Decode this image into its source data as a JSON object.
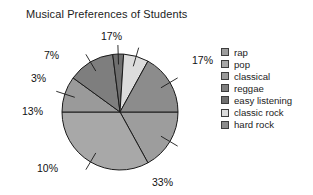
{
  "chart_data": {
    "type": "pie",
    "title": "Musical Preferences of Students",
    "xlabel": "",
    "ylabel": "",
    "legend_position": "right",
    "grid": false,
    "start_angle_deg": 0,
    "direction": "clockwise",
    "categories": [
      "rap",
      "pop",
      "classical",
      "reggae",
      "easy listening",
      "classic rock",
      "hard rock"
    ],
    "values": [
      17,
      33,
      10,
      13,
      3,
      7,
      17
    ],
    "value_labels": [
      "17%",
      "33%",
      "10%",
      "13%",
      "3%",
      "7%",
      "17%"
    ],
    "total": 100,
    "unit": "%",
    "colors": [
      "#9d9d9d",
      "#a8a8a8",
      "#9a9a9a",
      "#7e7e7e",
      "#6f6f6f",
      "#dcdcdc",
      "#8c8c8c"
    ],
    "slices": [
      {
        "label": "rap",
        "value": 17,
        "value_label": "17%",
        "color": "#9d9d9d",
        "callout_x": 192,
        "callout_y": 54
      },
      {
        "label": "pop",
        "value": 33,
        "value_label": "33%",
        "color": "#a8a8a8",
        "callout_x": 152,
        "callout_y": 176
      },
      {
        "label": "classical",
        "value": 10,
        "value_label": "10%",
        "color": "#9a9a9a",
        "callout_x": 37,
        "callout_y": 162
      },
      {
        "label": "reggae",
        "value": 13,
        "value_label": "13%",
        "color": "#7e7e7e",
        "callout_x": 22,
        "callout_y": 105
      },
      {
        "label": "easy listening",
        "value": 3,
        "value_label": "3%",
        "color": "#6f6f6f",
        "callout_x": 31,
        "callout_y": 72
      },
      {
        "label": "classic rock",
        "value": 7,
        "value_label": "7%",
        "color": "#dcdcdc",
        "callout_x": 44,
        "callout_y": 49
      },
      {
        "label": "hard rock",
        "value": 17,
        "value_label": "17%",
        "color": "#8c8c8c",
        "callout_x": 101,
        "callout_y": 30
      }
    ]
  },
  "legend": {
    "items": [
      {
        "label": "rap",
        "color": "#9d9d9d"
      },
      {
        "label": "pop",
        "color": "#a8a8a8"
      },
      {
        "label": "classical",
        "color": "#9a9a9a"
      },
      {
        "label": "reggae",
        "color": "#7e7e7e"
      },
      {
        "label": "easy listening",
        "color": "#6f6f6f"
      },
      {
        "label": "classic rock",
        "color": "#dcdcdc"
      },
      {
        "label": "hard rock",
        "color": "#8c8c8c"
      }
    ]
  },
  "style": {
    "slice_outline": "#1a1a1a",
    "text_color": "#1c1c1c",
    "background": "#ffffff"
  }
}
